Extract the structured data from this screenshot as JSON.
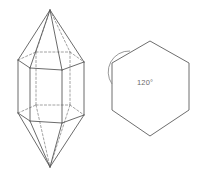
{
  "figure": {
    "background_color": "#ffffff",
    "solid_edge_color": "#5a5a5a",
    "hidden_edge_color": "#8a8a8a",
    "hexagon_edge_color": "#6e6e6e",
    "annotation_color": "#6a6a6a"
  },
  "crystal": {
    "name": "hexagonal-dipyramid",
    "top_apex": {
      "x": 50,
      "y": 10
    },
    "bottom_apex": {
      "x": 50,
      "y": 167
    },
    "top_hexagon_front": [
      {
        "x": 18,
        "y": 60
      },
      {
        "x": 30,
        "y": 68
      },
      {
        "x": 62,
        "y": 70
      },
      {
        "x": 84,
        "y": 62
      }
    ],
    "top_hexagon_back": [
      {
        "x": 18,
        "y": 60
      },
      {
        "x": 36,
        "y": 52
      },
      {
        "x": 70,
        "y": 52
      },
      {
        "x": 84,
        "y": 62
      }
    ],
    "bottom_hexagon_front": [
      {
        "x": 18,
        "y": 113
      },
      {
        "x": 30,
        "y": 121
      },
      {
        "x": 62,
        "y": 123
      },
      {
        "x": 84,
        "y": 115
      }
    ],
    "bottom_hexagon_back": [
      {
        "x": 18,
        "y": 113
      },
      {
        "x": 36,
        "y": 105
      },
      {
        "x": 70,
        "y": 105
      },
      {
        "x": 84,
        "y": 115
      }
    ],
    "visible_vertical_edges": [
      {
        "x": 18,
        "y1": 60,
        "y2": 113
      },
      {
        "x": 30,
        "y1": 68,
        "y2": 121
      },
      {
        "x": 62,
        "y1": 70,
        "y2": 123
      },
      {
        "x": 84,
        "y1": 62,
        "y2": 115
      }
    ],
    "hidden_vertical_edges": [
      {
        "x": 36,
        "y1": 52,
        "y2": 105
      },
      {
        "x": 70,
        "y1": 52,
        "y2": 105
      }
    ]
  },
  "hexagon": {
    "name": "regular-hexagon-cross-section",
    "vertices": [
      {
        "x": 150,
        "y": 41
      },
      {
        "x": 189,
        "y": 63
      },
      {
        "x": 189,
        "y": 110
      },
      {
        "x": 150,
        "y": 136
      },
      {
        "x": 112,
        "y": 110
      },
      {
        "x": 112,
        "y": 63
      }
    ],
    "angle_label": "120°",
    "angle_value": 120,
    "angle_unit": "degrees",
    "angle_vertex": {
      "x": 112,
      "y": 63
    },
    "angle_label_position": {
      "x": 137,
      "y": 82
    }
  }
}
